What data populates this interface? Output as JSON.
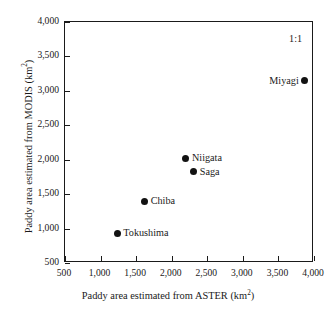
{
  "chart_data": {
    "type": "scatter",
    "title": "",
    "xlabel": "Paddy area estimated from ASTER (km2)",
    "ylabel": "Paddy area estimated from MODIS (km2)",
    "xlabel_base": "Paddy area estimated from ASTER (km",
    "xlabel_sup": "2",
    "xlabel_tail": ")",
    "ylabel_base": "Paddy area estimated from MODIS (km",
    "ylabel_sup": "2",
    "ylabel_tail": ")",
    "xlim": [
      500,
      4000
    ],
    "ylim": [
      500,
      4000
    ],
    "grid": false,
    "legend": "none",
    "annotations": [
      {
        "text": "1:1",
        "x": 3650,
        "y": 3830
      }
    ],
    "xticks": [
      500,
      1000,
      1500,
      2000,
      2500,
      3000,
      3500,
      4000
    ],
    "yticks": [
      500,
      1000,
      1500,
      2000,
      2500,
      3000,
      3500,
      4000
    ],
    "xtick_labels": [
      "500",
      "1,000",
      "1,500",
      "2,000",
      "2,500",
      "3,000",
      "3,500",
      "4,000"
    ],
    "ytick_labels": [
      "500",
      "1,000",
      "1,500",
      "2,000",
      "2,500",
      "3,000",
      "3,500",
      "4,000"
    ],
    "marker_color": "#121212",
    "axis_color": "#1a1a1a",
    "points": [
      {
        "label": "Miyagi",
        "x": 3870,
        "y": 3150,
        "label_side": "left"
      },
      {
        "label": "Niigata",
        "x": 2200,
        "y": 2020,
        "label_side": "right"
      },
      {
        "label": "Saga",
        "x": 2310,
        "y": 1825,
        "label_side": "right"
      },
      {
        "label": "Chiba",
        "x": 1620,
        "y": 1395,
        "label_side": "right"
      },
      {
        "label": "Tokushima",
        "x": 1235,
        "y": 935,
        "label_side": "right"
      }
    ]
  }
}
